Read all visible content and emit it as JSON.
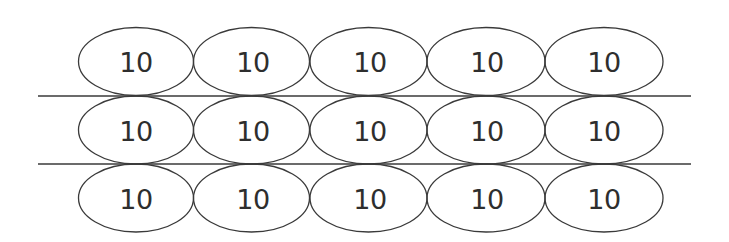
{
  "diagram": {
    "stroke_color": "#3a3a3a",
    "text_color": "#2e2e2e",
    "background": "#ffffff",
    "rows": [
      {
        "cells": [
          "10",
          "10",
          "10",
          "10",
          "10"
        ]
      },
      {
        "cells": [
          "10",
          "10",
          "10",
          "10",
          "10"
        ]
      },
      {
        "cells": [
          "10",
          "10",
          "10",
          "10",
          "10"
        ]
      }
    ],
    "dividers": 2
  }
}
